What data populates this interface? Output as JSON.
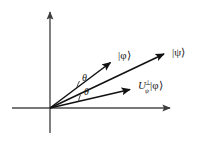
{
  "figure": {
    "background_color": "#ffffff",
    "ink_color": "#111111",
    "axis_color": "#4a4a4a",
    "origin": {
      "x": 50,
      "y": 108
    },
    "axes": [
      {
        "name": "vertical-axis",
        "from": {
          "x": 50,
          "y": 133
        },
        "to": {
          "x": 50,
          "y": 10
        },
        "arrow_at_end": true
      },
      {
        "name": "horizontal-axis",
        "from": {
          "x": 12,
          "y": 108
        },
        "to": {
          "x": 172,
          "y": 108
        },
        "arrow_at_end": true
      }
    ],
    "vectors": [
      {
        "id": "phi",
        "label": "|φ⟩",
        "tip": {
          "x": 113,
          "y": 60
        },
        "label_pos": {
          "x": 118,
          "y": 59
        }
      },
      {
        "id": "psi",
        "label": "|ψ⟩",
        "tip": {
          "x": 167,
          "y": 52
        },
        "label_pos": {
          "x": 172,
          "y": 55
        }
      },
      {
        "id": "u-perp-psi-phi",
        "label_base": "U",
        "label_superscript": "⊥",
        "label_subscript": "ψ",
        "label_operand": "|φ⟩",
        "label_full": "U⊥ψ|φ⟩",
        "tip": {
          "x": 133,
          "y": 88
        },
        "label_pos": {
          "x": 138,
          "y": 88
        }
      }
    ],
    "angles": [
      {
        "id": "theta-upper",
        "label": "θ",
        "label_pos": {
          "x": 82,
          "y": 81
        },
        "between": [
          "psi",
          "phi"
        ]
      },
      {
        "id": "theta-lower",
        "label": "θ",
        "label_pos": {
          "x": 84,
          "y": 95
        },
        "between": [
          "u-perp-psi-phi",
          "psi"
        ]
      }
    ]
  }
}
